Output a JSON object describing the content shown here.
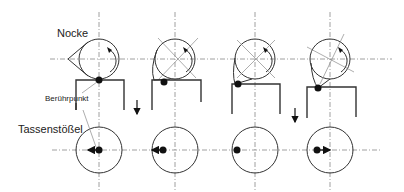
{
  "labels": {
    "cam": "Nocke",
    "contact_point": "Berührpunkt",
    "tappet": "Tassenstößel"
  },
  "colors": {
    "line": "#333333",
    "centerline": "#888888",
    "background": "#ffffff"
  },
  "stages": [
    {
      "index": 1,
      "cam_rotation_deg": 0,
      "contact_offset": 0,
      "motion_arrow": "left"
    },
    {
      "index": 2,
      "cam_rotation_deg": 45,
      "contact_offset": -13,
      "motion_arrow": "left"
    },
    {
      "index": 3,
      "cam_rotation_deg": 90,
      "contact_offset": -19,
      "motion_arrow": "none"
    },
    {
      "index": 4,
      "cam_rotation_deg": 120,
      "contact_offset": -14,
      "motion_arrow": "right"
    }
  ],
  "icons": {
    "rotation": "curved-arrow-icon",
    "push_down": "down-arrow-icon"
  }
}
